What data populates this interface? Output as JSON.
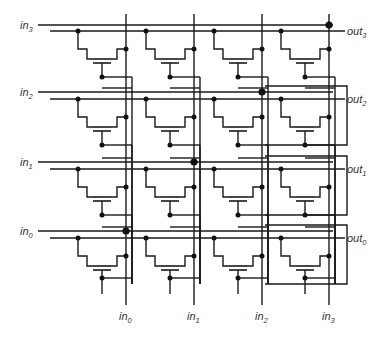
{
  "colors": {
    "ink": "#1a1a1a",
    "label": "#333333",
    "background": "#ffffff"
  },
  "row_labels": [
    {
      "base": "in",
      "sub": "3"
    },
    {
      "base": "in",
      "sub": "2"
    },
    {
      "base": "in",
      "sub": "1"
    },
    {
      "base": "in",
      "sub": "0"
    }
  ],
  "output_labels": [
    {
      "base": "out",
      "sub": "3"
    },
    {
      "base": "out",
      "sub": "2"
    },
    {
      "base": "out",
      "sub": "1"
    },
    {
      "base": "out",
      "sub": "0"
    }
  ],
  "column_labels": [
    {
      "base": "in",
      "sub": "0"
    },
    {
      "base": "in",
      "sub": "1"
    },
    {
      "base": "in",
      "sub": "2"
    },
    {
      "base": "in",
      "sub": "3"
    }
  ],
  "geometry": {
    "row_in_y": [
      25,
      92,
      162,
      231
    ],
    "row_out_y": [
      31,
      99,
      169,
      238
    ],
    "col_x": [
      126,
      194,
      262,
      329
    ],
    "row_start_x": 38,
    "out_start_x": 50,
    "row_end_x": 333,
    "out_end_x": 345,
    "col_top_y": 14,
    "col_bottom_y": 305,
    "cell_tap_offset": -55,
    "diag_dot_cells": [
      [
        0,
        3
      ],
      [
        1,
        2
      ],
      [
        2,
        1
      ],
      [
        3,
        0
      ]
    ]
  }
}
